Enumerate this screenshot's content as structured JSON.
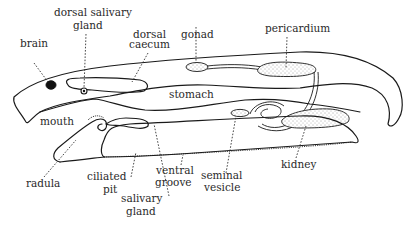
{
  "figure": {
    "colors": {
      "background": "#ffffff",
      "ink": "#1a1a1a",
      "label_text": "#2a2a2a"
    }
  },
  "labels": {
    "brain": "brain",
    "dorsal_salivary_gland_1": "dorsal salivary",
    "dorsal_salivary_gland_2": "gland",
    "dorsal_caecum_1": "dorsal",
    "dorsal_caecum_2": "caecum",
    "gonad": "gonad",
    "pericardium": "pericardium",
    "stomach": "stomach",
    "mouth": "mouth",
    "radula": "radula",
    "ciliated_pit_1": "ciliated",
    "ciliated_pit_2": "pit",
    "salivary_gland_1": "salivary",
    "salivary_gland_2": "gland",
    "ventral_groove_1": "ventral",
    "ventral_groove_2": "groove",
    "seminal_vesicle_1": "seminal",
    "seminal_vesicle_2": "vesicle",
    "kidney": "kidney"
  }
}
